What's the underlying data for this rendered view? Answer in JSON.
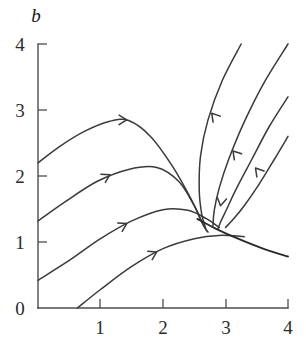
{
  "chart_data": {
    "type": "line",
    "title": "",
    "xlabel": "",
    "ylabel": "b",
    "xlim": [
      0,
      4
    ],
    "ylim": [
      0,
      4
    ],
    "grid": false,
    "legend": "none",
    "x_ticks": [
      "1",
      "2",
      "3",
      "4"
    ],
    "x_tick_values": [
      1,
      2,
      3,
      4
    ],
    "y_ticks": [
      "0",
      "1",
      "2",
      "3",
      "4"
    ],
    "y_tick_values": [
      0,
      1,
      2,
      3,
      4
    ],
    "saddle_point": [
      2.65,
      1.2
    ],
    "series": [
      {
        "name": "trajectory-1-upper-left",
        "direction": "rightward-into-saddle",
        "points": [
          [
            0.0,
            2.2
          ],
          [
            0.35,
            2.45
          ],
          [
            0.75,
            2.68
          ],
          [
            1.15,
            2.83
          ],
          [
            1.45,
            2.84
          ],
          [
            1.8,
            2.6
          ],
          [
            2.15,
            2.15
          ],
          [
            2.45,
            1.65
          ],
          [
            2.62,
            1.3
          ],
          [
            2.7,
            1.17
          ]
        ]
      },
      {
        "name": "trajectory-2-mid-left",
        "direction": "rightward-into-saddle",
        "points": [
          [
            0.0,
            1.32
          ],
          [
            0.45,
            1.62
          ],
          [
            0.95,
            1.92
          ],
          [
            1.45,
            2.1
          ],
          [
            1.9,
            2.13
          ],
          [
            2.25,
            1.92
          ],
          [
            2.5,
            1.55
          ],
          [
            2.65,
            1.25
          ],
          [
            2.72,
            1.15
          ]
        ]
      },
      {
        "name": "trajectory-3-lower-left",
        "direction": "rightward-into-saddle",
        "points": [
          [
            0.0,
            0.42
          ],
          [
            0.5,
            0.72
          ],
          [
            1.0,
            1.05
          ],
          [
            1.5,
            1.32
          ],
          [
            2.0,
            1.49
          ],
          [
            2.4,
            1.48
          ],
          [
            2.7,
            1.35
          ],
          [
            2.9,
            1.22
          ]
        ]
      },
      {
        "name": "trajectory-4-bottom",
        "direction": "rightward-into-saddle",
        "points": [
          [
            0.63,
            0.0
          ],
          [
            1.0,
            0.28
          ],
          [
            1.5,
            0.63
          ],
          [
            2.0,
            0.9
          ],
          [
            2.5,
            1.05
          ],
          [
            2.9,
            1.1
          ],
          [
            3.3,
            1.08
          ]
        ]
      },
      {
        "name": "trajectory-5-incoming-left-of-top",
        "direction": "down-left-into-saddle",
        "points": [
          [
            3.25,
            4.0
          ],
          [
            2.95,
            3.45
          ],
          [
            2.72,
            2.85
          ],
          [
            2.6,
            2.3
          ],
          [
            2.58,
            1.78
          ],
          [
            2.62,
            1.42
          ],
          [
            2.68,
            1.22
          ]
        ]
      },
      {
        "name": "trajectory-6-incoming-middle",
        "direction": "down-left-into-saddle",
        "points": [
          [
            4.0,
            4.0
          ],
          [
            3.62,
            3.42
          ],
          [
            3.3,
            2.82
          ],
          [
            3.05,
            2.25
          ],
          [
            2.9,
            1.82
          ],
          [
            2.82,
            1.48
          ],
          [
            2.8,
            1.25
          ]
        ]
      },
      {
        "name": "trajectory-7-incoming-right-inner",
        "direction": "down-left-into-saddle",
        "points": [
          [
            4.0,
            3.2
          ],
          [
            3.7,
            2.75
          ],
          [
            3.42,
            2.25
          ],
          [
            3.18,
            1.82
          ],
          [
            3.02,
            1.5
          ],
          [
            2.92,
            1.3
          ],
          [
            2.88,
            1.2
          ]
        ]
      },
      {
        "name": "trajectory-8-incoming-right-outer",
        "direction": "down-left-into-saddle",
        "points": [
          [
            4.0,
            2.6
          ],
          [
            3.78,
            2.25
          ],
          [
            3.52,
            1.85
          ],
          [
            3.3,
            1.55
          ],
          [
            3.12,
            1.34
          ],
          [
            3.0,
            1.22
          ]
        ]
      },
      {
        "name": "separatrix-outgoing",
        "direction": "rightward-out-of-saddle",
        "points": [
          [
            2.55,
            1.35
          ],
          [
            2.85,
            1.2
          ],
          [
            3.2,
            1.05
          ],
          [
            3.6,
            0.9
          ],
          [
            4.0,
            0.78
          ]
        ]
      }
    ],
    "arrows": [
      {
        "at": [
          1.42,
          2.85
        ],
        "dir": "right"
      },
      {
        "at": [
          1.15,
          2.02
        ],
        "dir": "right-up"
      },
      {
        "at": [
          1.42,
          1.28
        ],
        "dir": "right-up"
      },
      {
        "at": [
          1.9,
          0.85
        ],
        "dir": "right-up"
      },
      {
        "at": [
          2.78,
          2.95
        ],
        "dir": "down-left"
      },
      {
        "at": [
          3.12,
          2.38
        ],
        "dir": "down-left"
      },
      {
        "at": [
          3.48,
          2.12
        ],
        "dir": "down-left"
      },
      {
        "at": [
          2.92,
          1.55
        ],
        "dir": "down"
      }
    ]
  },
  "labels": {
    "y_axis_name": "b",
    "x0": "",
    "x1": "1",
    "x2": "2",
    "x3": "3",
    "x4": "4",
    "y0": "0",
    "y1": "1",
    "y2": "2",
    "y3": "3",
    "y4": "4"
  }
}
